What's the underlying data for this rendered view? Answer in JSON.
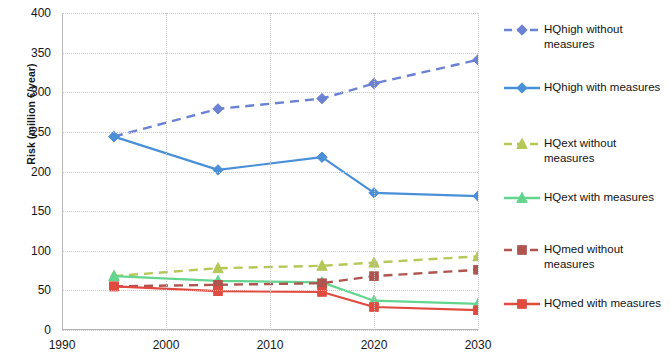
{
  "axes": {
    "ylabel": "Risk (million €/year)",
    "yticks": [
      "0",
      "50",
      "100",
      "150",
      "200",
      "250",
      "300",
      "350",
      "400"
    ],
    "xticks": [
      "1990",
      "2000",
      "2010",
      "2020",
      "2030"
    ]
  },
  "legend": {
    "items": [
      {
        "label": "HQhigh without measures",
        "color": "#6a81d4",
        "marker": "diamond",
        "dash": "dashed",
        "name": "hqhigh-without-measures"
      },
      {
        "label": "HQhigh with measures",
        "color": "#4a90d9",
        "marker": "diamond",
        "dash": "solid",
        "name": "hqhigh-with-measures"
      },
      {
        "label": "HQext without measures",
        "color": "#b5c756",
        "marker": "triangle",
        "dash": "dashed",
        "name": "hqext-without-measures"
      },
      {
        "label": "HQext with measures",
        "color": "#63d58f",
        "marker": "triangle",
        "dash": "solid",
        "name": "hqext-with-measures"
      },
      {
        "label": "HQmed without measures",
        "color": "#b0544f",
        "marker": "square",
        "dash": "dashed",
        "name": "hqmed-without-measures"
      },
      {
        "label": "HQmed with measures",
        "color": "#e04a3f",
        "marker": "square",
        "dash": "solid",
        "name": "hqmed-with-measures"
      }
    ]
  },
  "chart_data": {
    "type": "line",
    "title": "",
    "xlabel": "",
    "ylabel": "Risk (million €/year)",
    "xlim": [
      1990,
      2030
    ],
    "ylim": [
      0,
      400
    ],
    "ytick_values": [
      0,
      50,
      100,
      150,
      200,
      250,
      300,
      350,
      400
    ],
    "xtick_values": [
      1990,
      2000,
      2010,
      2020,
      2030
    ],
    "grid": true,
    "legend_position": "right",
    "x": [
      1995,
      2005,
      2015,
      2020,
      2030
    ],
    "series": [
      {
        "name": "HQhigh without measures",
        "values": [
          244,
          279,
          292,
          311,
          341
        ],
        "color": "#6a81d4",
        "marker": "diamond",
        "dash": "dashed"
      },
      {
        "name": "HQhigh with measures",
        "values": [
          244,
          202,
          218,
          173,
          169
        ],
        "color": "#4a90d9",
        "marker": "diamond",
        "dash": "solid"
      },
      {
        "name": "HQext without measures",
        "values": [
          68,
          78,
          81,
          85,
          93
        ],
        "color": "#b5c756",
        "marker": "triangle",
        "dash": "dashed"
      },
      {
        "name": "HQext with measures",
        "values": [
          68,
          62,
          60,
          37,
          33
        ],
        "color": "#63d58f",
        "marker": "triangle",
        "dash": "solid"
      },
      {
        "name": "HQmed without measures",
        "values": [
          55,
          57,
          59,
          68,
          76
        ],
        "color": "#b0544f",
        "marker": "square",
        "dash": "dashed"
      },
      {
        "name": "HQmed with measures",
        "values": [
          55,
          49,
          48,
          29,
          25
        ],
        "color": "#e04a3f",
        "marker": "square",
        "dash": "solid"
      }
    ]
  }
}
